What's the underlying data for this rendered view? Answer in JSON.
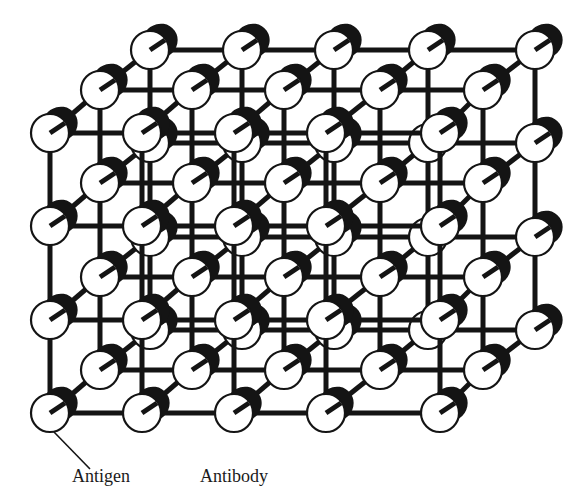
{
  "figure": {
    "type": "antigen-antibody lattice",
    "colors": {
      "stroke": "#141414",
      "antigen_fill": "#ffffff",
      "antibody_fill": "#141414",
      "background": "#ffffff"
    }
  },
  "labels": {
    "antigen": "Antigen",
    "antibody": "Antibody"
  },
  "lattice": {
    "rows": 4,
    "cols": 5,
    "layers": [
      {
        "name": "back",
        "x": [
          150,
          242,
          334,
          428,
          535
        ],
        "y": [
          50,
          143,
          237,
          330
        ]
      },
      {
        "name": "middle",
        "x": [
          100,
          192,
          284,
          380,
          483
        ],
        "y": [
          90,
          183,
          277,
          370
        ]
      },
      {
        "name": "front",
        "x": [
          50,
          142,
          234,
          326,
          440
        ],
        "y": [
          133,
          226,
          320,
          413
        ]
      }
    ],
    "radius": 19
  }
}
